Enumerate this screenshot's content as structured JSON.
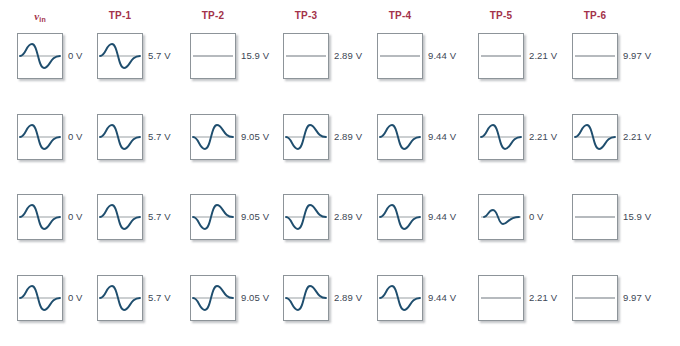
{
  "figure": {
    "colors": {
      "header_text": "#A3324A",
      "voltage_text": "#3b4654",
      "waveform": "#1F4E6E",
      "baseline": "#8d9499",
      "box_border": "#8d9499",
      "background": "#ffffff"
    }
  },
  "columns": [
    {
      "id": "vin",
      "label": "v",
      "sub": "in",
      "is_vin": true,
      "x": 17
    },
    {
      "id": "tp1",
      "label": "TP-1",
      "sub": "",
      "is_vin": false,
      "x": 97
    },
    {
      "id": "tp2",
      "label": "TP-2",
      "sub": "",
      "is_vin": false,
      "x": 190
    },
    {
      "id": "tp3",
      "label": "TP-3",
      "sub": "",
      "is_vin": false,
      "x": 283
    },
    {
      "id": "tp4",
      "label": "TP-4",
      "sub": "",
      "is_vin": false,
      "x": 377
    },
    {
      "id": "tp5",
      "label": "TP-5",
      "sub": "",
      "is_vin": false,
      "x": 478
    },
    {
      "id": "tp6",
      "label": "TP-6",
      "sub": "",
      "is_vin": false,
      "x": 572
    }
  ],
  "row_tops": [
    33,
    114,
    194,
    275
  ],
  "rows": [
    {
      "row": 1,
      "cells": [
        {
          "column": "vin",
          "waveform": "sine",
          "voltage": "0 V"
        },
        {
          "column": "tp1",
          "waveform": "sine",
          "voltage": "5.7 V"
        },
        {
          "column": "tp2",
          "waveform": "flat",
          "voltage": "15.9 V"
        },
        {
          "column": "tp3",
          "waveform": "flat",
          "voltage": "2.89 V"
        },
        {
          "column": "tp4",
          "waveform": "flat",
          "voltage": "9.44 V"
        },
        {
          "column": "tp5",
          "waveform": "flat",
          "voltage": "2.21 V"
        },
        {
          "column": "tp6",
          "waveform": "flat",
          "voltage": "9.97 V"
        }
      ]
    },
    {
      "row": 2,
      "cells": [
        {
          "column": "vin",
          "waveform": "sine",
          "voltage": "0 V"
        },
        {
          "column": "tp1",
          "waveform": "sine",
          "voltage": "5.7 V"
        },
        {
          "column": "tp2",
          "waveform": "sine-inverted",
          "voltage": "9.05 V"
        },
        {
          "column": "tp3",
          "waveform": "sine-inverted",
          "voltage": "2.89 V"
        },
        {
          "column": "tp4",
          "waveform": "sine",
          "voltage": "9.44 V"
        },
        {
          "column": "tp5",
          "waveform": "sine",
          "voltage": "2.21 V"
        },
        {
          "column": "tp6",
          "waveform": "sine",
          "voltage": "2.21 V"
        }
      ]
    },
    {
      "row": 3,
      "cells": [
        {
          "column": "vin",
          "waveform": "sine",
          "voltage": "0 V"
        },
        {
          "column": "tp1",
          "waveform": "sine",
          "voltage": "5.7 V"
        },
        {
          "column": "tp2",
          "waveform": "sine-inverted",
          "voltage": "9.05 V"
        },
        {
          "column": "tp3",
          "waveform": "sine-inverted",
          "voltage": "2.89 V"
        },
        {
          "column": "tp4",
          "waveform": "sine",
          "voltage": "9.44 V"
        },
        {
          "column": "tp5",
          "waveform": "sine-small",
          "voltage": "0 V"
        },
        {
          "column": "tp6",
          "waveform": "flat",
          "voltage": "15.9 V"
        }
      ]
    },
    {
      "row": 4,
      "cells": [
        {
          "column": "vin",
          "waveform": "sine",
          "voltage": "0 V"
        },
        {
          "column": "tp1",
          "waveform": "sine",
          "voltage": "5.7 V"
        },
        {
          "column": "tp2",
          "waveform": "sine-inverted",
          "voltage": "9.05 V"
        },
        {
          "column": "tp3",
          "waveform": "sine-inverted",
          "voltage": "2.89 V"
        },
        {
          "column": "tp4",
          "waveform": "sine",
          "voltage": "9.44 V"
        },
        {
          "column": "tp5",
          "waveform": "flat",
          "voltage": "2.21 V"
        },
        {
          "column": "tp6",
          "waveform": "flat",
          "voltage": "9.97 V"
        }
      ]
    }
  ],
  "waveform_paths": {
    "sine": "M2,22 C8,22 8,10 14,10 C20,10 20,34 26,34 C32,34 32,22 42,22",
    "sine-inverted": "M2,22 C8,22 8,34 14,34 C20,34 20,10 26,10 C32,10 32,22 42,22",
    "sine-small": "M5,22 C9,22 9,15 14,15 C19,15 19,29 24,29 C29,29 29,22 40,22",
    "flat": ""
  },
  "baseline_path": "M2,22 L42,22"
}
